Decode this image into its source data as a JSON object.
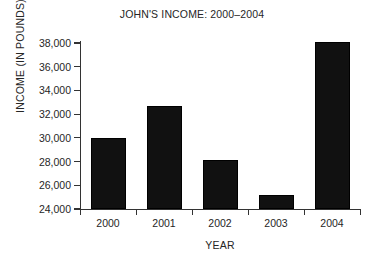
{
  "chart_data": {
    "type": "bar",
    "title": "JOHN'S INCOME: 2000–2004",
    "xlabel": "YEAR",
    "ylabel": "INCOME (IN POUNDS)",
    "categories": [
      "2000",
      "2001",
      "2002",
      "2003",
      "2004"
    ],
    "values": [
      30000,
      32700,
      28100,
      25200,
      38100
    ],
    "ytick_labels": [
      "38,000",
      "36,000",
      "34,000",
      "32,000",
      "30,000",
      "28,000",
      "26,000",
      "24,000"
    ],
    "ytick_values": [
      38000,
      36000,
      34000,
      32000,
      30000,
      28000,
      26000,
      24000
    ],
    "ylim": [
      24000,
      38000
    ],
    "grid": false,
    "legend": null,
    "bar_color": "#111111",
    "axis_color": "#333333",
    "background": "#ffffff"
  }
}
